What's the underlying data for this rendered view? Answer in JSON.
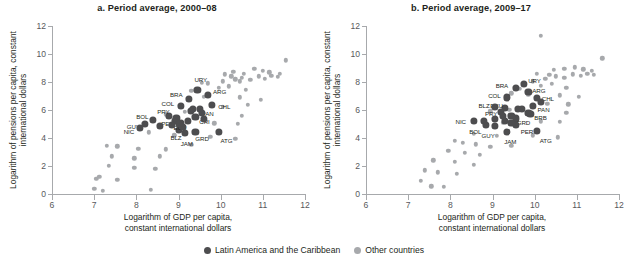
{
  "figure": {
    "xlabel_line1": "Logarithm of GDP per capita,",
    "xlabel_line2": "constant international dollars",
    "ylabel": "Logarithm of pensions per capita, constant international dollars",
    "xticks": [
      "6",
      "7",
      "8",
      "9",
      "10",
      "11",
      "12"
    ],
    "yticks": [
      "0",
      "2",
      "4",
      "6",
      "8",
      "10",
      "12"
    ]
  },
  "legend": {
    "position": "bottom-center",
    "items": [
      {
        "label": "Latin America and the Caribbean",
        "color": "#4d4d4f",
        "key": "lac"
      },
      {
        "label": "Other countries",
        "color": "#a7a9ac",
        "key": "oth"
      }
    ]
  },
  "chart_data": [
    {
      "id": "panel_a",
      "type": "scatter",
      "title": "a. Period average, 2000–08",
      "xlabel": "Logarithm of GDP per capita, constant international dollars",
      "ylabel": "Logarithm of pensions per capita, constant international dollars",
      "xlim": [
        6,
        12
      ],
      "ylim": [
        0,
        12
      ],
      "xticks": [
        6,
        7,
        8,
        9,
        10,
        11,
        12
      ],
      "yticks": [
        0,
        2,
        4,
        6,
        8,
        10,
        12
      ],
      "grid": false,
      "series": [
        {
          "name": "Latin America and the Caribbean",
          "color": "#4d4d4f",
          "points": [
            {
              "label": "URY",
              "x": 9.45,
              "y": 7.45,
              "lx": -3,
              "ly": -11
            },
            {
              "label": "ARG",
              "x": 9.7,
              "y": 7.05,
              "lx": 5,
              "ly": -4
            },
            {
              "label": "BRA",
              "x": 9.25,
              "y": 6.8,
              "lx": -19,
              "ly": -5
            },
            {
              "label": "CHL",
              "x": 9.8,
              "y": 6.35,
              "lx": 6,
              "ly": 1
            },
            {
              "label": "COL",
              "x": 9.05,
              "y": 6.3,
              "lx": -19,
              "ly": -3
            },
            {
              "label": "PAN",
              "x": 9.5,
              "y": 6.05,
              "lx": 2,
              "ly": 4
            },
            {
              "label": "CRI",
              "x": 9.4,
              "y": 5.5,
              "lx": 4,
              "ly": 4
            },
            {
              "label": "PRY",
              "x": 8.78,
              "y": 5.6,
              "lx": -12,
              "ly": -5
            },
            {
              "label": "BOL",
              "x": 8.4,
              "y": 5.3,
              "lx": -17,
              "ly": -4
            },
            {
              "label": "PER",
              "x": 8.92,
              "y": 5.2,
              "lx": -14,
              "ly": 2
            },
            {
              "label": "GUY",
              "x": 8.2,
              "y": 5.0,
              "lx": -18,
              "ly": 2
            },
            {
              "label": "NIC",
              "x": 8.08,
              "y": 4.7,
              "lx": -16,
              "ly": 3
            },
            {
              "label": "BLZ",
              "x": 9.0,
              "y": 4.6,
              "lx": -8,
              "ly": 7
            },
            {
              "label": "JAM",
              "x": 9.15,
              "y": 4.35,
              "lx": -4,
              "ly": 10
            },
            {
              "label": "GRD",
              "x": 9.4,
              "y": 4.45,
              "lx": 0,
              "ly": 6
            },
            {
              "label": "ATG",
              "x": 9.95,
              "y": 4.45,
              "lx": 2,
              "ly": 8
            },
            {
              "label": "ECU",
              "x": 9.05,
              "y": 5.05,
              "lx": -7,
              "ly": 4
            },
            {
              "label": "DOM",
              "x": 9.22,
              "y": 5.25,
              "lx": 0,
              "ly": 0
            },
            {
              "label": "MEX",
              "x": 9.55,
              "y": 5.8,
              "lx": 0,
              "ly": 0
            },
            {
              "label": "SLV",
              "x": 8.95,
              "y": 5.45,
              "lx": 0,
              "ly": 0
            },
            {
              "label": "VEN",
              "x": 9.35,
              "y": 6.1,
              "lx": 0,
              "ly": 0
            },
            {
              "label": "GTM",
              "x": 8.85,
              "y": 4.95,
              "lx": 0,
              "ly": 0
            },
            {
              "label": "HND",
              "x": 8.55,
              "y": 4.85,
              "lx": 0,
              "ly": 0
            },
            {
              "label": "TTO",
              "x": 9.3,
              "y": 5.95,
              "lx": 0,
              "ly": 0
            },
            {
              "label": "LCA",
              "x": 9.1,
              "y": 4.8,
              "lx": 0,
              "ly": 0
            },
            {
              "label": "VCT",
              "x": 9.0,
              "y": 5.0,
              "lx": 0,
              "ly": 0
            },
            {
              "label": "KNA",
              "x": 9.6,
              "y": 5.35,
              "lx": 0,
              "ly": 0
            }
          ]
        },
        {
          "name": "Other countries",
          "color": "#a7a9ac",
          "points": [
            {
              "x": 7.0,
              "y": 0.35
            },
            {
              "x": 7.2,
              "y": 0.25
            },
            {
              "x": 8.35,
              "y": 0.3
            },
            {
              "x": 7.05,
              "y": 1.1
            },
            {
              "x": 7.12,
              "y": 1.25
            },
            {
              "x": 7.55,
              "y": 1.0
            },
            {
              "x": 7.35,
              "y": 2.0
            },
            {
              "x": 7.95,
              "y": 1.85
            },
            {
              "x": 8.45,
              "y": 1.8
            },
            {
              "x": 7.42,
              "y": 2.7
            },
            {
              "x": 7.95,
              "y": 2.55
            },
            {
              "x": 8.55,
              "y": 2.7
            },
            {
              "x": 7.3,
              "y": 3.45
            },
            {
              "x": 7.55,
              "y": 3.4
            },
            {
              "x": 8.05,
              "y": 3.25
            },
            {
              "x": 8.7,
              "y": 3.2
            },
            {
              "x": 9.3,
              "y": 3.5
            },
            {
              "x": 8.3,
              "y": 4.4
            },
            {
              "x": 8.9,
              "y": 4.2
            },
            {
              "x": 9.75,
              "y": 4.1
            },
            {
              "x": 10.35,
              "y": 3.95
            },
            {
              "x": 9.05,
              "y": 4.9
            },
            {
              "x": 9.85,
              "y": 5.05
            },
            {
              "x": 10.4,
              "y": 5.0
            },
            {
              "x": 8.7,
              "y": 5.7
            },
            {
              "x": 9.15,
              "y": 5.85
            },
            {
              "x": 10.5,
              "y": 5.6
            },
            {
              "x": 10.05,
              "y": 6.25
            },
            {
              "x": 10.65,
              "y": 6.35
            },
            {
              "x": 9.6,
              "y": 6.95
            },
            {
              "x": 10.45,
              "y": 6.9
            },
            {
              "x": 10.95,
              "y": 6.75
            },
            {
              "x": 9.95,
              "y": 7.6
            },
            {
              "x": 10.2,
              "y": 7.7
            },
            {
              "x": 10.6,
              "y": 7.45
            },
            {
              "x": 9.7,
              "y": 7.9
            },
            {
              "x": 10.05,
              "y": 8.05
            },
            {
              "x": 10.35,
              "y": 8.2
            },
            {
              "x": 10.5,
              "y": 8.3
            },
            {
              "x": 10.7,
              "y": 8.15
            },
            {
              "x": 10.9,
              "y": 8.4
            },
            {
              "x": 11.05,
              "y": 8.25
            },
            {
              "x": 11.2,
              "y": 8.45
            },
            {
              "x": 11.35,
              "y": 8.35
            },
            {
              "x": 10.3,
              "y": 8.75
            },
            {
              "x": 10.55,
              "y": 8.6
            },
            {
              "x": 10.8,
              "y": 8.95
            },
            {
              "x": 11.0,
              "y": 8.8
            },
            {
              "x": 11.15,
              "y": 8.7
            },
            {
              "x": 11.4,
              "y": 8.6
            },
            {
              "x": 11.55,
              "y": 9.55
            },
            {
              "x": 10.1,
              "y": 8.55
            },
            {
              "x": 10.25,
              "y": 8.4
            },
            {
              "x": 10.45,
              "y": 8.05
            },
            {
              "x": 9.3,
              "y": 7.35
            },
            {
              "x": 9.55,
              "y": 7.95
            }
          ]
        }
      ]
    },
    {
      "id": "panel_b",
      "type": "scatter",
      "title": "b. Period average, 2009–17",
      "xlabel": "Logarithm of GDP per capita, constant international dollars",
      "ylabel": "Logarithm of pensions per capita, constant international dollars",
      "xlim": [
        6,
        12
      ],
      "ylim": [
        0,
        12
      ],
      "xticks": [
        6,
        7,
        8,
        9,
        10,
        11,
        12
      ],
      "yticks": [
        0,
        2,
        4,
        6,
        8,
        10,
        12
      ],
      "grid": false,
      "series": [
        {
          "name": "Latin America and the Caribbean",
          "color": "#4d4d4f",
          "points": [
            {
              "label": "URY",
              "x": 9.75,
              "y": 7.85,
              "lx": 4,
              "ly": -4
            },
            {
              "label": "ARG",
              "x": 9.85,
              "y": 7.3,
              "lx": 4,
              "ly": -2
            },
            {
              "label": "BRA",
              "x": 9.55,
              "y": 7.55,
              "lx": -20,
              "ly": -3
            },
            {
              "label": "CHL",
              "x": 10.05,
              "y": 6.85,
              "lx": 5,
              "ly": 0
            },
            {
              "label": "COL",
              "x": 9.35,
              "y": 6.9,
              "lx": -19,
              "ly": -2
            },
            {
              "label": "PAN",
              "x": 9.95,
              "y": 6.3,
              "lx": 5,
              "ly": 3
            },
            {
              "label": "BRB",
              "x": 9.85,
              "y": 5.8,
              "lx": 6,
              "ly": 4
            },
            {
              "label": "ECU",
              "x": 9.3,
              "y": 6.15,
              "lx": -15,
              "ly": -3
            },
            {
              "label": "BLZ",
              "x": 9.05,
              "y": 6.2,
              "lx": -16,
              "ly": -2
            },
            {
              "label": "PRY",
              "x": 9.2,
              "y": 5.85,
              "lx": -16,
              "ly": 1
            },
            {
              "label": "CRI",
              "x": 9.6,
              "y": 6.05,
              "lx": 0,
              "ly": 0
            },
            {
              "label": "GRD",
              "x": 9.55,
              "y": 5.4,
              "lx": 1,
              "ly": 4
            },
            {
              "label": "PER",
              "x": 9.55,
              "y": 4.95,
              "lx": 5,
              "ly": 6
            },
            {
              "label": "NIC",
              "x": 8.55,
              "y": 5.25,
              "lx": -18,
              "ly": 0
            },
            {
              "label": "BOL",
              "x": 8.85,
              "y": 4.95,
              "lx": -17,
              "ly": 6
            },
            {
              "label": "GUY",
              "x": 9.05,
              "y": 4.85,
              "lx": -13,
              "ly": 9
            },
            {
              "label": "JAM",
              "x": 9.35,
              "y": 4.45,
              "lx": -3,
              "ly": 9
            },
            {
              "label": "ATG",
              "x": 10.05,
              "y": 4.5,
              "lx": 3,
              "ly": 9
            },
            {
              "label": "DOM",
              "x": 9.45,
              "y": 5.55,
              "lx": 0,
              "ly": 0
            },
            {
              "label": "MEX",
              "x": 9.7,
              "y": 6.05,
              "lx": 0,
              "ly": 0
            },
            {
              "label": "SLV",
              "x": 9.25,
              "y": 5.6,
              "lx": 0,
              "ly": 0
            },
            {
              "label": "GTM",
              "x": 9.05,
              "y": 5.35,
              "lx": 0,
              "ly": 0
            },
            {
              "label": "HND",
              "x": 8.8,
              "y": 5.2,
              "lx": 0,
              "ly": 0
            },
            {
              "label": "TTO",
              "x": 10.15,
              "y": 6.55,
              "lx": 0,
              "ly": 0
            },
            {
              "label": "LCA",
              "x": 9.45,
              "y": 5.1,
              "lx": 0,
              "ly": 0
            },
            {
              "label": "VCT",
              "x": 9.3,
              "y": 5.25,
              "lx": 0,
              "ly": 0
            },
            {
              "label": "KNA",
              "x": 9.9,
              "y": 5.7,
              "lx": 0,
              "ly": 0
            }
          ]
        },
        {
          "name": "Other countries",
          "color": "#a7a9ac",
          "points": [
            {
              "x": 7.3,
              "y": 0.95
            },
            {
              "x": 7.55,
              "y": 0.55
            },
            {
              "x": 7.85,
              "y": 0.5
            },
            {
              "x": 7.4,
              "y": 1.7
            },
            {
              "x": 7.7,
              "y": 1.55
            },
            {
              "x": 8.15,
              "y": 1.45
            },
            {
              "x": 7.6,
              "y": 2.4
            },
            {
              "x": 8.1,
              "y": 2.3
            },
            {
              "x": 8.55,
              "y": 2.1
            },
            {
              "x": 7.95,
              "y": 3.1
            },
            {
              "x": 8.35,
              "y": 2.95
            },
            {
              "x": 8.7,
              "y": 2.8
            },
            {
              "x": 8.1,
              "y": 3.8
            },
            {
              "x": 8.3,
              "y": 3.65
            },
            {
              "x": 8.6,
              "y": 3.55
            },
            {
              "x": 8.95,
              "y": 3.35
            },
            {
              "x": 9.45,
              "y": 3.45
            },
            {
              "x": 8.55,
              "y": 4.3
            },
            {
              "x": 9.1,
              "y": 4.15
            },
            {
              "x": 9.95,
              "y": 4.2
            },
            {
              "x": 10.55,
              "y": 4.05
            },
            {
              "x": 9.25,
              "y": 5.1
            },
            {
              "x": 10.15,
              "y": 5.2
            },
            {
              "x": 10.6,
              "y": 5.15
            },
            {
              "x": 8.95,
              "y": 5.9
            },
            {
              "x": 9.4,
              "y": 6.0
            },
            {
              "x": 10.75,
              "y": 5.8
            },
            {
              "x": 10.3,
              "y": 6.45
            },
            {
              "x": 10.8,
              "y": 6.4
            },
            {
              "x": 9.85,
              "y": 7.1
            },
            {
              "x": 10.6,
              "y": 7.05
            },
            {
              "x": 11.05,
              "y": 6.95
            },
            {
              "x": 10.15,
              "y": 7.75
            },
            {
              "x": 10.4,
              "y": 7.85
            },
            {
              "x": 10.75,
              "y": 7.6
            },
            {
              "x": 9.95,
              "y": 8.05
            },
            {
              "x": 10.25,
              "y": 8.25
            },
            {
              "x": 10.5,
              "y": 8.4
            },
            {
              "x": 10.7,
              "y": 8.3
            },
            {
              "x": 10.9,
              "y": 8.55
            },
            {
              "x": 11.1,
              "y": 8.45
            },
            {
              "x": 11.25,
              "y": 8.6
            },
            {
              "x": 11.4,
              "y": 8.5
            },
            {
              "x": 10.45,
              "y": 8.85
            },
            {
              "x": 10.7,
              "y": 8.95
            },
            {
              "x": 10.95,
              "y": 9.05
            },
            {
              "x": 11.15,
              "y": 8.9
            },
            {
              "x": 11.35,
              "y": 8.8
            },
            {
              "x": 11.6,
              "y": 9.7
            },
            {
              "x": 10.05,
              "y": 8.6
            },
            {
              "x": 10.35,
              "y": 8.5
            },
            {
              "x": 9.65,
              "y": 7.5
            },
            {
              "x": 9.45,
              "y": 7.2
            },
            {
              "x": 10.15,
              "y": 11.3
            }
          ]
        }
      ]
    }
  ]
}
